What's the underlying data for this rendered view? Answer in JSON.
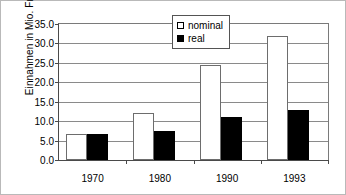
{
  "chart_data": {
    "type": "bar",
    "title": "",
    "xlabel": "",
    "ylabel": "Einnahmen in Mio. Fr.",
    "categories": [
      "1970",
      "1980",
      "1990",
      "1993"
    ],
    "series": [
      {
        "name": "nominal",
        "values": [
          6.7,
          12.2,
          24.4,
          31.9
        ],
        "color": "#ffffff"
      },
      {
        "name": "real",
        "values": [
          6.8,
          7.5,
          11.0,
          13.0
        ],
        "color": "#000000"
      }
    ],
    "ylim": [
      0.0,
      35.0
    ],
    "ytick_labels": [
      "0.0",
      "5.0",
      "10.0",
      "15.0",
      "20.0",
      "25.0",
      "30.0",
      "35.0"
    ],
    "ytick_values": [
      0.0,
      5.0,
      10.0,
      15.0,
      20.0,
      25.0,
      30.0,
      35.0
    ],
    "grid": true,
    "legend_position": "top-center",
    "legend_entries": [
      "nominal",
      "real"
    ]
  }
}
